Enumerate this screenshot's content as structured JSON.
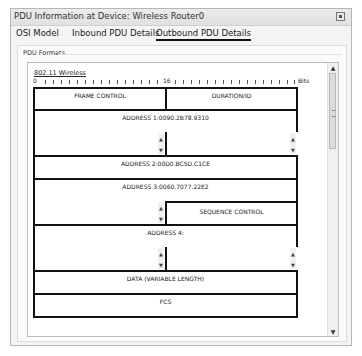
{
  "window": {
    "title": "PDU Information at Device: Wireless Router0",
    "close_icon": "close-icon"
  },
  "tabs": [
    {
      "label": "OSI Model",
      "active": false
    },
    {
      "label": "Inbound PDU Details",
      "active": false
    },
    {
      "label": "Outbound PDU Details",
      "active": true
    }
  ],
  "panel": {
    "label": "PDU Formats",
    "protocol": "802.11 Wireless",
    "ruler": {
      "start": "0",
      "mid": "16",
      "unit": "Bits"
    }
  },
  "fields": {
    "frame_control": "FRAME CONTROL",
    "duration_id": "DURATION/ID",
    "address1": "ADDRESS 1:0090.2B78.9310",
    "address2": "ADDRESS 2:00D0.BC5D.C1CE",
    "address3": "ADDRESS 3:0060.7077.22E2",
    "sequence_control": "SEQUENCE CONTROL",
    "address4": "ADDRESS 4:",
    "data": "DATA (VARIABLE LENGTH)",
    "fcs": "FCS"
  },
  "scroll": {
    "up": "▲",
    "down": "▼"
  }
}
